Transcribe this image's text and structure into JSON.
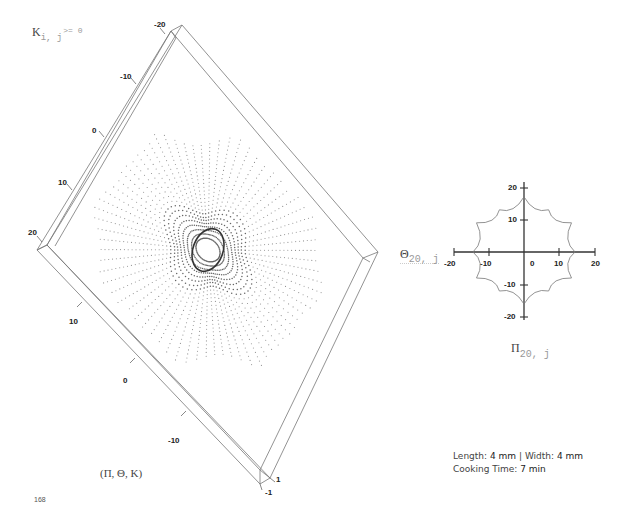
{
  "page": {
    "page_number": "168",
    "caption": {
      "length_label": "Length:",
      "length_value": "4 mm",
      "separator": "|",
      "width_label": "Width:",
      "width_value": "4 mm",
      "time_label": "Cooking Time:",
      "time_value": "7 min"
    }
  },
  "left_figure": {
    "condition_label": {
      "symbol": "K",
      "subscript": "i, j",
      "condition": ">= 0"
    },
    "axes_label": "(Π, Θ, K)"
  },
  "right_figure": {
    "y_label": {
      "symbol": "Θ",
      "subscript": "20, j"
    },
    "x_label": {
      "symbol": "Π",
      "subscript": "20, j"
    }
  },
  "chart_data": [
    {
      "type": "scatter",
      "title": "",
      "description": "3D point-cloud surface viewed from above inside a bounding box; concentric wavy rings of dots around a central elliptical hole with radial dotted lines",
      "axes_label": "(Π, Θ, K)",
      "axis_1": {
        "ticks": [
          -20,
          -10,
          0,
          10,
          20
        ],
        "label": "upper-left edge"
      },
      "axis_2": {
        "ticks": [
          10,
          0,
          -10
        ],
        "label": "lower-left edge"
      },
      "axis_3": {
        "ticks": [
          -1,
          1
        ],
        "label": "depth (K)"
      },
      "xlim": [
        -20,
        20
      ],
      "ylim": [
        -20,
        20
      ],
      "zlim": [
        -1,
        1
      ],
      "grid": false
    },
    {
      "type": "line",
      "title": "",
      "xlabel": "Π_{20,j}",
      "ylabel": "Θ_{20,j}",
      "xlim": [
        -20,
        20
      ],
      "ylim": [
        -20,
        20
      ],
      "x_ticks": [
        -20,
        -10,
        0,
        10,
        20
      ],
      "y_ticks": [
        20,
        10,
        -10,
        -20
      ],
      "series": [
        {
          "name": "closed curve (6-cusp star)",
          "points": [
            [
              0,
              17
            ],
            [
              7,
              13
            ],
            [
              13.5,
              9
            ],
            [
              14.5,
              0
            ],
            [
              13.5,
              -8
            ],
            [
              7,
              -12
            ],
            [
              0,
              -16
            ],
            [
              -7,
              -12
            ],
            [
              -13.5,
              -8
            ],
            [
              -14.5,
              0
            ],
            [
              -13.5,
              9
            ],
            [
              -7,
              13
            ],
            [
              0,
              17
            ]
          ]
        }
      ],
      "grid": false
    }
  ]
}
